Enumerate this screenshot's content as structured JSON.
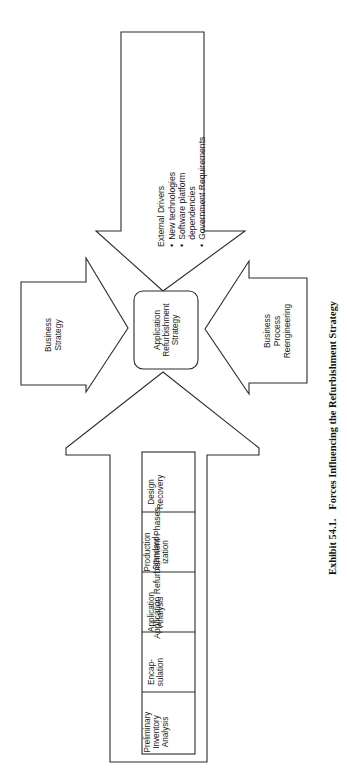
{
  "figure": {
    "caption_number": "Exhibit 54.1.",
    "caption_title": "Forces Influencing the Refurbishment Strategy",
    "line_color": "#2b2b2b",
    "background": "#ffffff"
  },
  "center": {
    "line1": "Application",
    "line2": "Refurbishment",
    "line3": "Strategy"
  },
  "top_arrow": {
    "heading": "External Drivers",
    "bullet_glyph": "•",
    "bullets": [
      {
        "line1": "New technologies",
        "line2": ""
      },
      {
        "line1": "Software platform",
        "line2": "dependencies"
      },
      {
        "line1": "Government Requirements",
        "line2": ""
      }
    ]
  },
  "left_arrow": {
    "line1": "Business",
    "line2": "Strategy"
  },
  "right_arrow": {
    "line1": "Business",
    "line2": "Process",
    "line3": "Reengineering"
  },
  "bottom_arrow": {
    "header": "Application Refurbishment Phases",
    "phases": [
      {
        "line1": "Preliminary",
        "line2": "Inventory",
        "line3": "Analysis"
      },
      {
        "line1": "Encap-",
        "line2": "sulation",
        "line3": ""
      },
      {
        "line1": "Application",
        "line2": "Analysis",
        "line3": ""
      },
      {
        "line1": "Production",
        "line2": "Standard-",
        "line3": "ization"
      },
      {
        "line1": "Design",
        "line2": "Recovery",
        "line3": ""
      }
    ]
  }
}
